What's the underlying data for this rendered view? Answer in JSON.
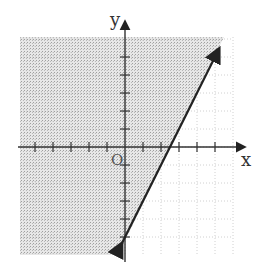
{
  "chart_data": {
    "type": "line",
    "title": "",
    "xlabel": "x",
    "ylabel": "y",
    "origin_label": "O",
    "xlim": [
      -6,
      6
    ],
    "ylim": [
      -6,
      6
    ],
    "x_ticks": [
      -5,
      -4,
      -3,
      -2,
      -1,
      1,
      2,
      3,
      4,
      5
    ],
    "y_ticks": [
      -5,
      -4,
      -3,
      -2,
      -1,
      1,
      2,
      3,
      4,
      5
    ],
    "grid": true,
    "series": [
      {
        "name": "boundary line",
        "equation": "y = 2x - 5",
        "x": [
          -0.2,
          2.5,
          5.2
        ],
        "y": [
          -5.4,
          0,
          5.4
        ],
        "style": "solid",
        "arrows": "both"
      }
    ],
    "shaded_region": {
      "inequality": "y >= 2x - 5",
      "side": "above-left of line",
      "color": "#c8c8c8"
    }
  },
  "colors": {
    "background": "#ffffff",
    "shade": "#cfcfcf",
    "grid": "#bdbdbd",
    "axis": "#333333",
    "line": "#222222"
  }
}
